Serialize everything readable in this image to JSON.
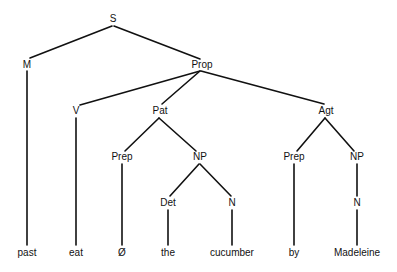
{
  "diagram": {
    "type": "syntax-tree",
    "nodes": [
      {
        "id": "S",
        "label": "S",
        "x": 113,
        "y": 19
      },
      {
        "id": "M",
        "label": "M",
        "x": 27,
        "y": 65
      },
      {
        "id": "Prop",
        "label": "Prop",
        "x": 202,
        "y": 65
      },
      {
        "id": "V",
        "label": "V",
        "x": 76,
        "y": 111
      },
      {
        "id": "Pat",
        "label": "Pat",
        "x": 160,
        "y": 111
      },
      {
        "id": "Agt",
        "label": "Agt",
        "x": 326,
        "y": 111
      },
      {
        "id": "Prep1",
        "label": "Prep",
        "x": 122,
        "y": 157
      },
      {
        "id": "NP1",
        "label": "NP",
        "x": 200,
        "y": 157
      },
      {
        "id": "Prep2",
        "label": "Prep",
        "x": 294,
        "y": 157
      },
      {
        "id": "NP2",
        "label": "NP",
        "x": 357,
        "y": 157
      },
      {
        "id": "Det",
        "label": "Det",
        "x": 168,
        "y": 203
      },
      {
        "id": "N1",
        "label": "N",
        "x": 232,
        "y": 203
      },
      {
        "id": "N2",
        "label": "N",
        "x": 357,
        "y": 203
      },
      {
        "id": "past",
        "label": "past",
        "x": 27,
        "y": 253
      },
      {
        "id": "eat",
        "label": "eat",
        "x": 76,
        "y": 253
      },
      {
        "id": "null",
        "label": "Ø",
        "x": 122,
        "y": 253
      },
      {
        "id": "the",
        "label": "the",
        "x": 168,
        "y": 253
      },
      {
        "id": "cucumber",
        "label": "cucumber",
        "x": 232,
        "y": 253
      },
      {
        "id": "by",
        "label": "by",
        "x": 294,
        "y": 253
      },
      {
        "id": "Madeleine",
        "label": "Madeleine",
        "x": 357,
        "y": 253
      }
    ],
    "edges": [
      {
        "from": "S",
        "to": "M",
        "x1": 112,
        "y1": 26,
        "x2": 30,
        "y2": 58
      },
      {
        "from": "S",
        "to": "Prop",
        "x1": 114,
        "y1": 26,
        "x2": 200,
        "y2": 59
      },
      {
        "from": "M",
        "to": "past",
        "x1": 27,
        "y1": 71,
        "x2": 27,
        "y2": 245
      },
      {
        "from": "Prop",
        "to": "V",
        "x1": 200,
        "y1": 71,
        "x2": 80,
        "y2": 105
      },
      {
        "from": "Prop",
        "to": "Pat",
        "x1": 200,
        "y1": 71,
        "x2": 162,
        "y2": 104
      },
      {
        "from": "Prop",
        "to": "Agt",
        "x1": 201,
        "y1": 71,
        "x2": 324,
        "y2": 104
      },
      {
        "from": "V",
        "to": "eat",
        "x1": 76,
        "y1": 118,
        "x2": 76,
        "y2": 245
      },
      {
        "from": "Pat",
        "to": "Prep1",
        "x1": 159,
        "y1": 118,
        "x2": 125,
        "y2": 151
      },
      {
        "from": "Pat",
        "to": "NP1",
        "x1": 159,
        "y1": 118,
        "x2": 196,
        "y2": 151
      },
      {
        "from": "Agt",
        "to": "Prep2",
        "x1": 325,
        "y1": 118,
        "x2": 297,
        "y2": 151
      },
      {
        "from": "Agt",
        "to": "NP2",
        "x1": 325,
        "y1": 118,
        "x2": 354,
        "y2": 151
      },
      {
        "from": "Prep1",
        "to": "null",
        "x1": 122,
        "y1": 164,
        "x2": 122,
        "y2": 245
      },
      {
        "from": "NP1",
        "to": "Det",
        "x1": 199,
        "y1": 164,
        "x2": 170,
        "y2": 196
      },
      {
        "from": "NP1",
        "to": "N1",
        "x1": 200,
        "y1": 164,
        "x2": 231,
        "y2": 196
      },
      {
        "from": "Det",
        "to": "the",
        "x1": 168,
        "y1": 210,
        "x2": 168,
        "y2": 245
      },
      {
        "from": "N1",
        "to": "cucumber",
        "x1": 232,
        "y1": 210,
        "x2": 232,
        "y2": 245
      },
      {
        "from": "Prep2",
        "to": "by",
        "x1": 294,
        "y1": 164,
        "x2": 294,
        "y2": 245
      },
      {
        "from": "NP2",
        "to": "N2",
        "x1": 357,
        "y1": 164,
        "x2": 357,
        "y2": 196
      },
      {
        "from": "N2",
        "to": "Madeleine",
        "x1": 357,
        "y1": 210,
        "x2": 357,
        "y2": 245
      }
    ]
  }
}
